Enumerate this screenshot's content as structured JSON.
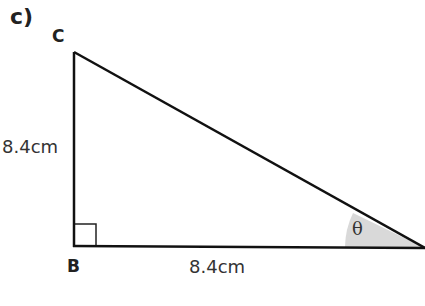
{
  "question": {
    "part_label": "c)"
  },
  "triangle": {
    "vertices": [
      {
        "name": "C",
        "label": "C"
      },
      {
        "name": "B",
        "label": "B",
        "right_angle": true
      },
      {
        "name": "A",
        "label": ""
      }
    ],
    "sides": {
      "CB": "8.4cm",
      "BA": "8.4cm"
    },
    "angle_label": "θ",
    "colors": {
      "stroke": "#111111",
      "angle_fill": "#d9d9d9"
    }
  }
}
